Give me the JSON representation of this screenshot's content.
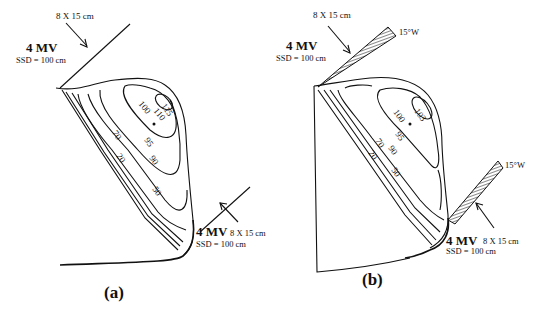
{
  "panels": [
    {
      "id": "a",
      "label": "(a)",
      "beam_top": {
        "energy": "4 MV",
        "ssd": "SSD = 100 cm",
        "field": "8 X 15 cm"
      },
      "beam_bottom": {
        "energy": "4 MV",
        "ssd": "SSD = 100 cm",
        "field": "8 X 15 cm"
      },
      "isodose_labels": [
        "115",
        "110",
        "100",
        "95",
        "90",
        "70",
        "50",
        "20"
      ]
    },
    {
      "id": "b",
      "label": "(b)",
      "beam_top": {
        "energy": "4 MV",
        "ssd": "SSD = 100 cm",
        "field": "8 X 15 cm",
        "wedge": "15°W"
      },
      "beam_bottom": {
        "energy": "4 MV",
        "ssd": "SSD = 100 cm",
        "field": "8 X 15 cm",
        "wedge": "15°W"
      },
      "isodose_labels": [
        "103",
        "100",
        "95",
        "90",
        "70",
        "50",
        "20"
      ]
    }
  ]
}
